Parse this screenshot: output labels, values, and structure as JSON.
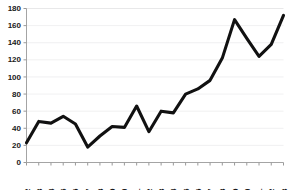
{
  "chart_data": {
    "type": "line",
    "title": "",
    "subtitle": "",
    "xlabel": "",
    "ylabel": "",
    "categories": [
      "1982",
      "1983",
      "1984",
      "1985",
      "1986",
      "1987",
      "1988",
      "1989",
      "1990",
      "1991",
      "1992",
      "1993",
      "1994",
      "1995",
      "1996",
      "1997",
      "1998",
      "1999",
      "2000",
      "2001",
      "2002",
      "2003"
    ],
    "x": [
      1982,
      1983,
      1984,
      1985,
      1986,
      1987,
      1988,
      1989,
      1990,
      1991,
      1992,
      1993,
      1994,
      1995,
      1996,
      1997,
      1998,
      1999,
      2000,
      2001,
      2002,
      2003
    ],
    "values": [
      23,
      48,
      46,
      54,
      45,
      18,
      31,
      42,
      41,
      66,
      36,
      60,
      58,
      80,
      86,
      96,
      122,
      167,
      145,
      124,
      138,
      172
    ],
    "series": [
      {
        "name": "series-1",
        "values": [
          23,
          48,
          46,
          54,
          45,
          18,
          31,
          42,
          41,
          66,
          36,
          60,
          58,
          80,
          86,
          96,
          122,
          167,
          145,
          124,
          138,
          172
        ],
        "color": "#111111"
      }
    ],
    "ylim": [
      0,
      180
    ],
    "xlim": [
      "1982",
      "2003"
    ],
    "yticks": [
      0,
      20,
      40,
      60,
      80,
      100,
      120,
      140,
      160,
      180
    ],
    "ytick_labels": [
      "0",
      "20",
      "40",
      "60",
      "80",
      "100",
      "120",
      "140",
      "160",
      "180"
    ],
    "xtick_labels": [
      "1982",
      "1983",
      "1984",
      "1985",
      "1986",
      "1987",
      "1988",
      "1989",
      "1990",
      "1991",
      "1992",
      "1993",
      "1994",
      "1995",
      "1996",
      "1997",
      "1998",
      "1999",
      "2000",
      "2001",
      "2002",
      "2003"
    ],
    "xtick_rotation": 90,
    "grid": true,
    "grid_axis": "y",
    "legend": false,
    "legend_position": "none",
    "annotations": [],
    "colors": {
      "line": "#111111",
      "grid": "#ececed",
      "axis": "#9a9a9a",
      "text": "#1a1a1a",
      "background": "#ffffff"
    }
  }
}
